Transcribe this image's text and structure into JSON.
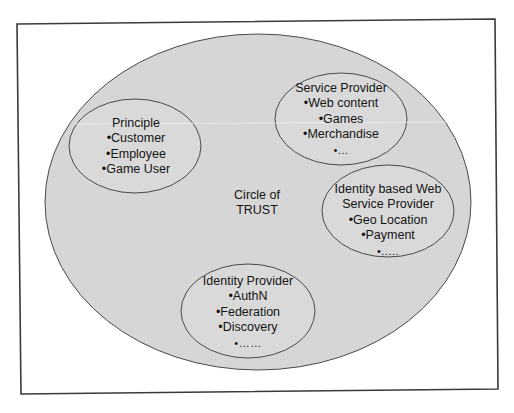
{
  "diagram": {
    "colors": {
      "frame_stroke": "#3a3a3a",
      "outer_fill": "#d6d6d6",
      "outer_stroke": "#4a4a4a",
      "inner_fill": "#d9d9d9",
      "inner_stroke": "#4a4a4a",
      "text": "#141414"
    },
    "frame": {
      "corners": [
        [
          17,
          24
        ],
        [
          495,
          19
        ],
        [
          498,
          389
        ],
        [
          21,
          394
        ]
      ]
    },
    "outer": {
      "title_lines": [
        "Circle of",
        "TRUST"
      ],
      "cx": 258,
      "cy": 202,
      "rx": 213,
      "ry": 168
    },
    "groups": [
      {
        "id": "principle",
        "title_lines": [
          "Principle"
        ],
        "items": [
          "•Customer",
          "•Employee",
          "•Game User"
        ],
        "cx": 135,
        "cy": 146,
        "rx": 66,
        "ry": 47
      },
      {
        "id": "service-provider",
        "title_lines": [
          "Service Provider"
        ],
        "items": [
          "•Web content",
          "•Games",
          "•Merchandise",
          "•..."
        ],
        "cx": 341,
        "cy": 119,
        "rx": 66,
        "ry": 46
      },
      {
        "id": "identity-based-wsp",
        "title_lines": [
          "Identity based Web",
          "Service Provider"
        ],
        "items": [
          "•Geo Location",
          "•Payment",
          "•....."
        ],
        "cx": 388,
        "cy": 211,
        "rx": 66,
        "ry": 46
      },
      {
        "id": "identity-provider",
        "title_lines": [
          "Identity Provider"
        ],
        "items": [
          "•AuthN",
          "•Federation",
          "•Discovery",
          "•……"
        ],
        "cx": 248,
        "cy": 311,
        "rx": 67,
        "ry": 47
      }
    ]
  }
}
